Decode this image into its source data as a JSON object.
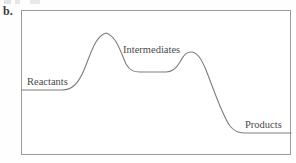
{
  "figure": {
    "panel_letter": "b.",
    "frame": {
      "x": 21,
      "y": 10,
      "width": 270,
      "height": 145,
      "border_color": "#9a9a9a"
    },
    "curve_color": "#7d7d7d",
    "label_color": "#4a4a4a"
  },
  "labels": {
    "reactants": "Reactants",
    "intermediates": "Intermediates",
    "products": "Products"
  },
  "chart_data": {
    "type": "line",
    "title": "",
    "subtitle": "",
    "xlabel": "",
    "ylabel": "",
    "grid": false,
    "legend": "none",
    "xlim": [
      21,
      291
    ],
    "ylim": [
      155,
      10
    ],
    "y_axis_direction": "inverted-pixels (lower pixel y = higher energy)",
    "annotations": [
      {
        "text": "Reactants",
        "x": 27,
        "y": 85,
        "anchor": "start"
      },
      {
        "text": "Intermediates",
        "x": 123,
        "y": 54,
        "anchor": "start"
      },
      {
        "text": "Products",
        "x": 245,
        "y": 129,
        "anchor": "start"
      }
    ],
    "levels": [
      {
        "name": "Reactants",
        "plateau_y": 90,
        "x_start": 22,
        "x_end": 68
      },
      {
        "name": "Transition state 1",
        "peak_y": 33,
        "x": 106
      },
      {
        "name": "Intermediates",
        "plateau_y": 72,
        "x_start": 122,
        "x_end": 175
      },
      {
        "name": "Transition state 2",
        "peak_y": 52,
        "x": 190
      },
      {
        "name": "Products",
        "plateau_y": 133,
        "x_start": 232,
        "x_end": 291
      }
    ],
    "path": "M 22 90 L 62 90 C 72 90 78 84 84 70 C 92 50 96 36 106 33 C 116 36 120 50 126 64 C 130 71 134 72 140 72 L 166 72 C 172 72 176 69 180 62 C 184 55 186 52 191 52 C 197 52 201 58 206 70 C 214 90 222 115 230 126 C 234 131 238 133 244 133 L 291 133",
    "x": [
      22,
      62,
      84,
      106,
      126,
      140,
      166,
      180,
      191,
      206,
      230,
      244,
      291
    ],
    "y": [
      90,
      90,
      70,
      33,
      64,
      72,
      72,
      62,
      52,
      70,
      126,
      133,
      133
    ]
  }
}
